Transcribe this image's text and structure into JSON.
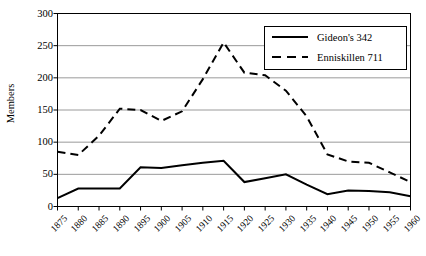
{
  "chart_data": {
    "type": "line",
    "title": "",
    "xlabel": "",
    "ylabel": "Members",
    "ylim": [
      0,
      300
    ],
    "ytick_step": 50,
    "yticks": [
      "0",
      "50",
      "100",
      "150",
      "200",
      "250",
      "300"
    ],
    "grid": "horizontal",
    "legend_position": "top-right",
    "x": [
      1875,
      1880,
      1885,
      1890,
      1895,
      1900,
      1905,
      1910,
      1915,
      1920,
      1925,
      1930,
      1935,
      1940,
      1945,
      1950,
      1955,
      1960
    ],
    "categories": [
      "1875",
      "1880",
      "1885",
      "1890",
      "1895",
      "1900",
      "1905",
      "1910",
      "1915",
      "1920",
      "1925",
      "1930",
      "1935",
      "1940",
      "1945",
      "1950",
      "1955",
      "1960"
    ],
    "series": [
      {
        "name": "Gideon's 342",
        "style": "solid",
        "color": "#000000",
        "values": [
          13,
          28,
          28,
          28,
          61,
          60,
          64,
          68,
          71,
          38,
          44,
          50,
          34,
          19,
          25,
          24,
          22,
          16
        ]
      },
      {
        "name": "Enniskillen 711",
        "style": "dashed",
        "color": "#000000",
        "values": [
          85,
          80,
          110,
          152,
          150,
          133,
          148,
          198,
          255,
          208,
          204,
          180,
          140,
          81,
          70,
          68,
          53,
          38
        ]
      }
    ]
  },
  "legend": {
    "entries": [
      {
        "label": "Gideon's 342",
        "style": "solid"
      },
      {
        "label": "Enniskillen 711",
        "style": "dashed"
      }
    ]
  }
}
